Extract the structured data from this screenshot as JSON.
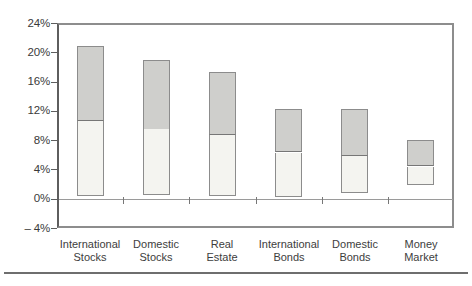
{
  "figure": {
    "background": "#ffffff",
    "bottom_rule_color": "#6e6e6e"
  },
  "colors": {
    "lower_segment_fill": "#f4f4f0",
    "upper_segment_fill": "#cfcfcc",
    "bar_border": "#8c8c8c",
    "segment_divider": "#767676",
    "axis_frame": "#8d8d8d",
    "left_axis": "#5e5e5e",
    "zero_line": "#9a9a9a",
    "text": "#3a3a3a"
  },
  "chart_data": {
    "type": "bar",
    "subtype": "floating-range-stacked",
    "title": "",
    "xlabel": "",
    "ylabel": "",
    "grid": false,
    "legend": false,
    "categories": [
      [
        "International",
        "Stocks"
      ],
      [
        "Domestic",
        "Stocks"
      ],
      [
        "Real",
        "Estate"
      ],
      [
        "International",
        "Bonds"
      ],
      [
        "Domestic",
        "Bonds"
      ],
      [
        "Money",
        "Market"
      ]
    ],
    "bars": [
      {
        "category": "International Stocks",
        "low": 0.4,
        "mid": 10.6,
        "high": 20.8
      },
      {
        "category": "Domestic Stocks",
        "low": 0.5,
        "mid": 9.5,
        "high": 19.0
      },
      {
        "category": "Real Estate",
        "low": 0.4,
        "mid": 8.7,
        "high": 17.3
      },
      {
        "category": "International Bonds",
        "low": 0.3,
        "mid": 6.3,
        "high": 12.2
      },
      {
        "category": "Domestic Bonds",
        "low": 0.8,
        "mid": 5.9,
        "high": 12.3
      },
      {
        "category": "Money Market",
        "low": 2.0,
        "mid": 4.4,
        "high": 8.0
      }
    ],
    "segments": {
      "lower": {
        "name": "lower-range-segment",
        "spans": "low to mid"
      },
      "upper": {
        "name": "upper-range-segment",
        "spans": "mid to high"
      }
    },
    "y_axis": {
      "min": -4,
      "max": 24,
      "tick_step": 4,
      "tick_values": [
        24,
        20,
        16,
        12,
        8,
        4,
        0,
        -4
      ],
      "tick_labels": [
        "24%",
        "20%",
        "16%",
        "12%",
        "8%",
        "4%",
        "0%",
        "– 4%"
      ]
    }
  }
}
